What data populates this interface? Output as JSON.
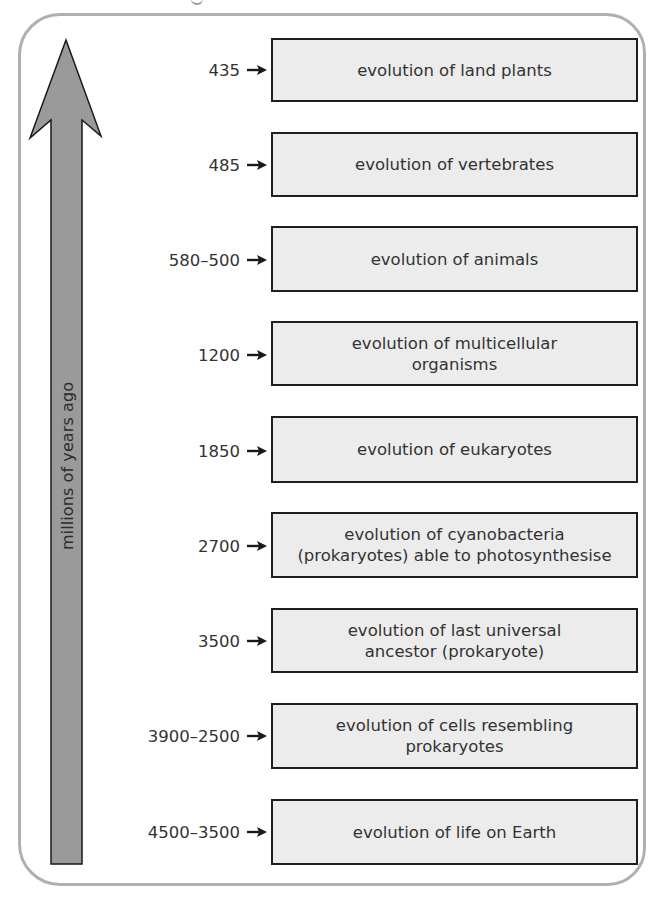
{
  "diagram": {
    "axis_label": "millions of years ago",
    "colors": {
      "arrow_fill": "#9a9a9a",
      "box_fill": "#ececec",
      "box_border": "#1e1e1e",
      "frame_border": "#b0b0b0",
      "text": "#333333"
    },
    "events": [
      {
        "date": "435",
        "label": "evolution of land plants"
      },
      {
        "date": "485",
        "label": "evolution of vertebrates"
      },
      {
        "date": "580–500",
        "label": "evolution of animals"
      },
      {
        "date": "1200",
        "label": "evolution of multicellular\norganisms"
      },
      {
        "date": "1850",
        "label": "evolution of eukaryotes"
      },
      {
        "date": "2700",
        "label": "evolution of cyanobacteria\n(prokaryotes) able to photosynthesise"
      },
      {
        "date": "3500",
        "label": "evolution of last universal\nancestor (prokaryote)"
      },
      {
        "date": "3900–2500",
        "label": "evolution of cells resembling\nprokaryotes"
      },
      {
        "date": "4500–3500",
        "label": "evolution of life on Earth"
      }
    ]
  }
}
